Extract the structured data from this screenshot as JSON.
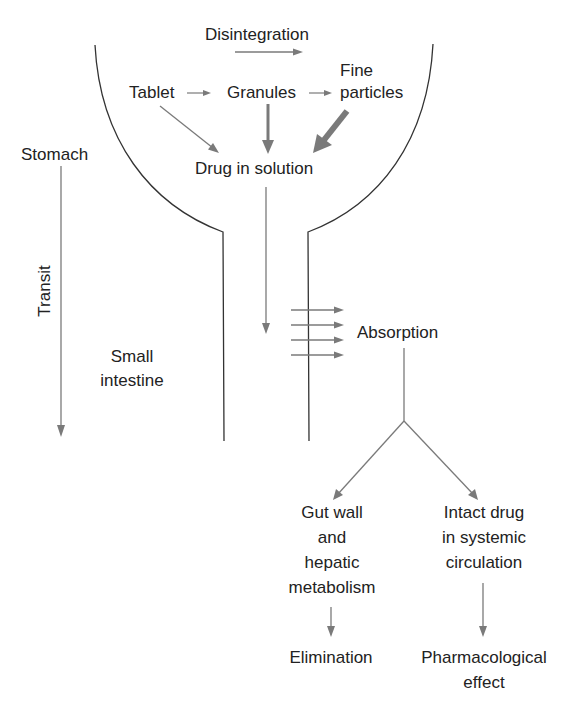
{
  "diagram": {
    "colors": {
      "text": "#222222",
      "outline": "#333333",
      "arrow": "#7a7a7a",
      "background": "#ffffff"
    },
    "labels": {
      "disintegration": "Disintegration",
      "tablet": "Tablet",
      "granules": "Granules",
      "fine_particles": [
        "Fine",
        "particles"
      ],
      "drug_in_solution": "Drug in solution",
      "stomach": "Stomach",
      "transit": "Transit",
      "small_intestine": [
        "Small",
        "intestine"
      ],
      "absorption": "Absorption",
      "gut_wall": [
        "Gut wall",
        "and",
        "hepatic",
        "metabolism"
      ],
      "intact_drug": [
        "Intact drug",
        "in systemic",
        "circulation"
      ],
      "elimination": "Elimination",
      "pharmacological_effect": [
        "Pharmacological",
        "effect"
      ]
    },
    "edges": [
      {
        "from": "Tablet",
        "to": "Granules",
        "weight": "thin"
      },
      {
        "from": "Granules",
        "to": "Fine particles",
        "weight": "thin"
      },
      {
        "from": "Tablet",
        "to": "Drug in solution",
        "weight": "thin"
      },
      {
        "from": "Granules",
        "to": "Drug in solution",
        "weight": "medium"
      },
      {
        "from": "Fine particles",
        "to": "Drug in solution",
        "weight": "thick"
      },
      {
        "from": "Drug in solution",
        "to": "Small intestine",
        "weight": "thin"
      },
      {
        "from": "Small intestine",
        "to": "Absorption",
        "weight": "thin",
        "count": 4
      },
      {
        "from": "Absorption",
        "to": "Gut wall and hepatic metabolism",
        "weight": "thin"
      },
      {
        "from": "Absorption",
        "to": "Intact drug in systemic circulation",
        "weight": "thin"
      },
      {
        "from": "Gut wall and hepatic metabolism",
        "to": "Elimination",
        "weight": "thin"
      },
      {
        "from": "Intact drug in systemic circulation",
        "to": "Pharmacological effect",
        "weight": "thin"
      },
      {
        "from": "Stomach",
        "to": "Small intestine",
        "label": "Transit",
        "weight": "thin"
      }
    ]
  }
}
